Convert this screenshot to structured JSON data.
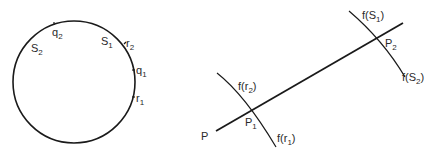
{
  "circle_figure": {
    "labels": {
      "q2": {
        "main": "q",
        "sub": "2"
      },
      "S2": {
        "main": "S",
        "sub": "2"
      },
      "S1": {
        "main": "S",
        "sub": "1"
      },
      "r2": {
        "main": "r",
        "sub": "2"
      },
      "q1": {
        "main": "q",
        "sub": "1"
      },
      "r1": {
        "main": "r",
        "sub": "1"
      }
    }
  },
  "line_figure": {
    "line_label": "P",
    "points": {
      "P1": {
        "main": "P",
        "sub": "1"
      },
      "P2": {
        "main": "P",
        "sub": "2"
      }
    },
    "arcs": {
      "f_r2": {
        "pre": "f(r",
        "sub": "2",
        "post": ")"
      },
      "f_r1": {
        "pre": "f(r",
        "sub": "1",
        "post": ")"
      },
      "f_S1": {
        "pre": "f(S",
        "sub": "1",
        "post": ")"
      },
      "f_S2": {
        "pre": "f(S",
        "sub": "2",
        "post": ")"
      }
    }
  },
  "colors": {
    "stroke": "#1a1a1a",
    "text": "#2a2a2a",
    "background": "#ffffff"
  }
}
